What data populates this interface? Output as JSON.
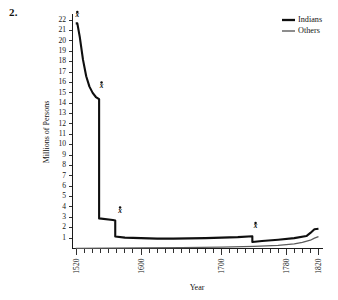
{
  "figure": {
    "number_label": "2."
  },
  "legend": {
    "position": "top-right",
    "entries": [
      {
        "label": "Indians",
        "color": "#0f0f0f",
        "width": 2.1
      },
      {
        "label": "Others",
        "color": "#5c5c5c",
        "width": 1.25
      }
    ]
  },
  "chart_data": {
    "type": "line",
    "title": "",
    "xlabel": "Year",
    "ylabel": "Millions of Persons",
    "xlim": [
      1515,
      1825
    ],
    "ylim": [
      0,
      22.6
    ],
    "grid": false,
    "legend_position": "top-right",
    "xticks_major": [
      1520,
      1600,
      1700,
      1780,
      1820
    ],
    "xtick_labels": [
      "1520",
      "1600",
      "1700",
      "1780",
      "1820"
    ],
    "xtick_minor_step": 10,
    "yticks": [
      1,
      2,
      3,
      4,
      5,
      6,
      7,
      8,
      9,
      10,
      11,
      12,
      13,
      14,
      15,
      16,
      17,
      18,
      19,
      20,
      21,
      22
    ],
    "ytick_labels": [
      "1",
      "2",
      "3",
      "4",
      "5",
      "6",
      "7",
      "8",
      "9",
      "10",
      "11",
      "12",
      "13",
      "14",
      "15",
      "16",
      "17",
      "18",
      "19",
      "20",
      "21",
      "22"
    ],
    "series": [
      {
        "name": "Indians",
        "color": "#0f0f0f",
        "x": [
          1519,
          1521,
          1524,
          1528,
          1532,
          1536,
          1540,
          1544,
          1548,
          1548,
          1565,
          1568,
          1568,
          1580,
          1600,
          1620,
          1640,
          1660,
          1680,
          1700,
          1720,
          1738,
          1738,
          1750,
          1770,
          1790,
          1805,
          1810,
          1815,
          1820
        ],
        "y": [
          21.7,
          21.7,
          20.4,
          18.2,
          16.6,
          15.6,
          15.0,
          14.6,
          14.4,
          2.9,
          2.75,
          2.7,
          1.15,
          1.05,
          1.0,
          0.95,
          0.95,
          0.98,
          1.0,
          1.05,
          1.1,
          1.18,
          0.62,
          0.72,
          0.85,
          1.0,
          1.2,
          1.5,
          1.85,
          1.9
        ]
      },
      {
        "name": "Others",
        "color": "#5c5c5c",
        "x": [
          1519,
          1560,
          1600,
          1650,
          1700,
          1740,
          1770,
          1790,
          1800,
          1810,
          1815,
          1820
        ],
        "y": [
          0.02,
          0.04,
          0.06,
          0.09,
          0.13,
          0.2,
          0.3,
          0.45,
          0.6,
          0.8,
          1.0,
          1.15
        ]
      }
    ],
    "annotations": [
      {
        "label": "x",
        "x": 1521,
        "y": 22.3,
        "note": "marker above 1520 peak"
      },
      {
        "label": "x",
        "x": 1551,
        "y": 15.5,
        "note": "marker at 1548 shoulder"
      },
      {
        "label": "x",
        "x": 1574,
        "y": 3.45,
        "note": "marker at 1568 step"
      },
      {
        "label": "x",
        "x": 1742,
        "y": 1.95,
        "note": "marker at 1738 step"
      }
    ]
  }
}
